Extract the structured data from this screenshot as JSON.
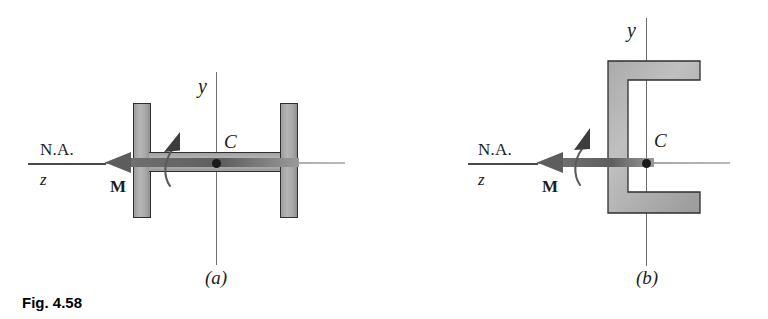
{
  "figure": {
    "caption": "Fig. 4.58",
    "panels": [
      {
        "id": "a",
        "sublabel": "(a)",
        "section_type": "wide-flange I-beam",
        "labels": {
          "y_axis": "y",
          "z_axis": "z",
          "neutral_axis": "N.A.",
          "centroid": "C",
          "moment": "M"
        }
      },
      {
        "id": "b",
        "sublabel": "(b)",
        "section_type": "channel",
        "labels": {
          "y_axis": "y",
          "z_axis": "z",
          "neutral_axis": "N.A.",
          "centroid": "C",
          "moment": "M"
        }
      }
    ]
  },
  "colors": {
    "steel_fill": "#b0b0b0",
    "steel_outline": "#2e2e2e",
    "axis": "#6e6e6e",
    "moment_arrow": "#6b6b6b",
    "text": "#1c1c1c",
    "background": "#ffffff"
  }
}
